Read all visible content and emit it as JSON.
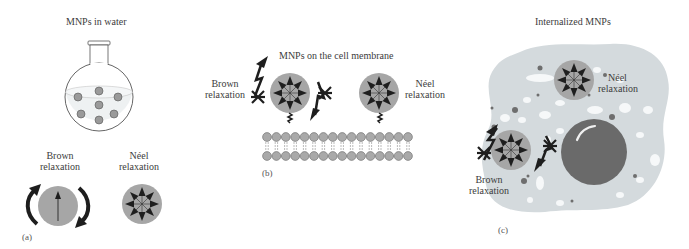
{
  "panels": {
    "a": {
      "tag": "(a)",
      "title": "MNPs in water",
      "brown_label": [
        "Brown",
        "relaxation"
      ],
      "neel_label": [
        "Néel",
        "relaxation"
      ]
    },
    "b": {
      "tag": "(b)",
      "title": "MNPs on the cell membrane",
      "brown_label": [
        "Brown",
        "relaxation"
      ],
      "neel_label": [
        "Néel",
        "relaxation"
      ],
      "membrane_heads_per_row": 16
    },
    "c": {
      "tag": "(c)",
      "title": "Internalized MNPs",
      "brown_label": [
        "Brown",
        "relaxation"
      ],
      "neel_label": [
        "Néel",
        "relaxation"
      ]
    }
  },
  "colors": {
    "particle_fill": "#a6a6a6",
    "arrow": "#1e1e1e",
    "cell_fill": "#d4dadd",
    "nucleus_fill": "#6a6a6a",
    "membrane_head": "#a9a9a9",
    "water": "#eef1f2"
  }
}
